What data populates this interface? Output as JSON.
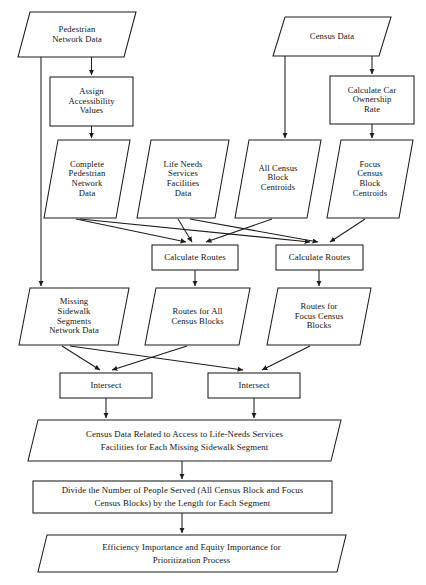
{
  "diagram": {
    "stroke_color": "#1d1d1d",
    "fill_color": "#ffffff",
    "nodes": {
      "pedestrian_network_data": {
        "label": "Pedestrian\nNetwork Data",
        "shape": "parallelogram"
      },
      "census_data": {
        "label": "Census Data",
        "shape": "parallelogram"
      },
      "assign_accessibility_values": {
        "label": "Assign\nAccessibility\nValues",
        "shape": "process"
      },
      "calculate_car_ownership_rate": {
        "label": "Calculate Car\nOwnership\nRate",
        "shape": "process"
      },
      "complete_pedestrian_network_data": {
        "label": "Complete\nPedestrian\nNetwork\nData",
        "shape": "parallelogram"
      },
      "life_needs_services_facilities_data": {
        "label": "Life Needs\nServices\nFacilities\nData",
        "shape": "parallelogram"
      },
      "all_census_block_centroids": {
        "label": "All Census\nBlock\nCentroids",
        "shape": "parallelogram"
      },
      "focus_census_block_centroids": {
        "label": "Focus\nCensus\nBlock\nCentroids",
        "shape": "parallelogram"
      },
      "calculate_routes_left": {
        "label": "Calculate Routes",
        "shape": "process"
      },
      "calculate_routes_right": {
        "label": "Calculate Routes",
        "shape": "process"
      },
      "missing_sidewalk_segments_network_data": {
        "label": "Missing\nSidewalk\nSegments\nNetwork Data",
        "shape": "parallelogram"
      },
      "routes_for_all_census_blocks": {
        "label": "Routes for All\nCensus Blocks",
        "shape": "parallelogram"
      },
      "routes_for_focus_census_blocks": {
        "label": "Routes for\nFocus Census\nBlocks",
        "shape": "parallelogram"
      },
      "intersect_left": {
        "label": "Intersect",
        "shape": "process"
      },
      "intersect_right": {
        "label": "Intersect",
        "shape": "process"
      },
      "census_data_related_to_access": {
        "label": "Census Data Related to Access to Life-Needs Services\nFacilities for Each Missing Sidewalk Segment",
        "shape": "parallelogram"
      },
      "divide_number_of_people_served": {
        "label": "Divide the Number of People Served (All Census Block and Focus\nCensus Blocks) by the Length for Each Segment",
        "shape": "process"
      },
      "efficiency_equity_importance": {
        "label": "Efficiency Importance and Equity Importance for\nPrioritization Process",
        "shape": "parallelogram"
      }
    }
  }
}
